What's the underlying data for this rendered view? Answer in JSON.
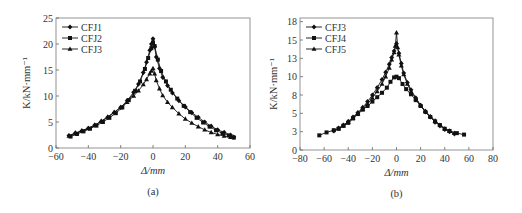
{
  "chart_data": [
    {
      "type": "line",
      "panel_label": "(a)",
      "title": "",
      "xlabel": "Δ/mm",
      "ylabel": "K/kN·mm⁻¹",
      "xlim": [
        -60,
        60
      ],
      "ylim": [
        0,
        25
      ],
      "xticks": [
        -60,
        -40,
        -20,
        0,
        20,
        40,
        60
      ],
      "xtick_labels": [
        "−60",
        "−40",
        "−20",
        "0",
        "20",
        "40",
        "60"
      ],
      "yticks": [
        0,
        5,
        10,
        15,
        20,
        25
      ],
      "ytick_labels": [
        "0",
        "5",
        "10",
        "15",
        "20",
        "25"
      ],
      "grid": false,
      "legend_position": "upper left",
      "series": [
        {
          "name": "CFJ1",
          "marker": "diamond",
          "x": [
            -52,
            -48,
            -44,
            -40,
            -36,
            -32,
            -28,
            -24,
            -20,
            -16,
            -12,
            -9,
            -6,
            -4,
            -2,
            -1,
            0,
            1,
            2,
            4,
            6,
            9,
            12,
            16,
            20,
            24,
            28,
            32,
            36,
            40,
            44,
            48,
            50
          ],
          "y": [
            2.4,
            2.9,
            3.3,
            3.8,
            4.4,
            5.1,
            5.9,
            6.8,
            7.8,
            9.1,
            10.7,
            12.3,
            14.5,
            16.5,
            18.8,
            20.0,
            21.0,
            19.5,
            17.5,
            15.3,
            13.6,
            12.0,
            10.6,
            9.1,
            7.9,
            6.8,
            5.9,
            5.0,
            4.2,
            3.5,
            3.0,
            2.5,
            2.1
          ]
        },
        {
          "name": "CFJ2",
          "marker": "square",
          "x": [
            -51,
            -47,
            -43,
            -39,
            -35,
            -31,
            -27,
            -23,
            -19,
            -15,
            -11,
            -8,
            -5,
            -3,
            -1,
            0,
            1,
            3,
            5,
            8,
            11,
            15,
            19,
            23,
            27,
            31,
            35,
            39,
            43,
            47,
            50
          ],
          "y": [
            2.2,
            2.7,
            3.2,
            3.7,
            4.3,
            5.0,
            5.8,
            6.7,
            7.8,
            9.2,
            11.0,
            12.8,
            15.2,
            17.3,
            19.2,
            20.3,
            19.6,
            17.0,
            14.8,
            12.8,
            11.2,
            9.5,
            8.1,
            6.9,
            5.8,
            4.9,
            4.1,
            3.4,
            2.8,
            2.4,
            2.0
          ]
        },
        {
          "name": "CFJ3",
          "marker": "triangle",
          "x": [
            -52,
            -48,
            -44,
            -40,
            -36,
            -32,
            -28,
            -24,
            -20,
            -16,
            -12,
            -9,
            -6,
            -4,
            -2,
            -1,
            0,
            1,
            2,
            4,
            6,
            9,
            12,
            16,
            20,
            24,
            28,
            32,
            36,
            40,
            44,
            48
          ],
          "y": [
            2.3,
            2.8,
            3.3,
            3.8,
            4.4,
            5.2,
            6.0,
            6.9,
            7.8,
            8.8,
            10.0,
            11.0,
            12.2,
            13.2,
            14.3,
            14.8,
            15.3,
            14.3,
            13.0,
            11.4,
            10.1,
            8.8,
            7.8,
            6.6,
            5.6,
            4.8,
            4.1,
            3.5,
            3.0,
            2.6,
            2.3,
            2.1
          ]
        }
      ]
    },
    {
      "type": "line",
      "panel_label": "(b)",
      "title": "",
      "xlabel": "Δ/mm",
      "ylabel": "K/kN·mm⁻¹",
      "xlim": [
        -80,
        80
      ],
      "ylim": [
        0,
        18
      ],
      "xticks": [
        -80,
        -60,
        -40,
        -20,
        0,
        20,
        40,
        60,
        80
      ],
      "xtick_labels": [
        "−80",
        "−60",
        "−40",
        "−20",
        "0",
        "20",
        "40",
        "60",
        "80"
      ],
      "yticks": [
        0,
        2.5,
        5,
        7.5,
        10,
        12.5,
        15,
        17.5
      ],
      "ytick_labels": [
        "0",
        "3",
        "5",
        "8",
        "10",
        "13",
        "15",
        "18"
      ],
      "grid": false,
      "legend_position": "upper left",
      "series": [
        {
          "name": "CFJ3",
          "marker": "diamond",
          "x": [
            -52,
            -48,
            -44,
            -40,
            -36,
            -32,
            -28,
            -24,
            -20,
            -16,
            -12,
            -9,
            -6,
            -4,
            -2,
            0,
            2,
            4,
            6,
            9,
            12,
            16,
            20,
            24,
            28,
            32,
            36,
            40,
            44,
            48
          ],
          "y": [
            2.6,
            3.0,
            3.4,
            3.9,
            4.5,
            5.1,
            5.8,
            6.6,
            7.5,
            8.5,
            9.6,
            10.6,
            11.7,
            12.6,
            13.5,
            14.5,
            13.2,
            11.8,
            10.5,
            9.2,
            8.2,
            7.1,
            6.1,
            5.2,
            4.5,
            3.8,
            3.3,
            2.8,
            2.5,
            2.2
          ]
        },
        {
          "name": "CFJ4",
          "marker": "square",
          "x": [
            -64,
            -58,
            -52,
            -48,
            -44,
            -40,
            -36,
            -32,
            -28,
            -24,
            -20,
            -16,
            -12,
            -8,
            -5,
            -2,
            0,
            2,
            5,
            8,
            12,
            16,
            20,
            24,
            28,
            32,
            36,
            40,
            44,
            50,
            56
          ],
          "y": [
            2.0,
            2.4,
            2.7,
            2.9,
            3.3,
            3.7,
            4.3,
            4.9,
            5.5,
            6.0,
            6.6,
            7.2,
            7.8,
            8.5,
            9.3,
            9.9,
            10.0,
            9.8,
            9.0,
            8.3,
            7.6,
            6.8,
            6.0,
            5.2,
            4.5,
            3.9,
            3.4,
            2.9,
            2.6,
            2.3,
            2.1
          ]
        },
        {
          "name": "CFJ5",
          "marker": "triangle",
          "x": [
            -48,
            -44,
            -40,
            -36,
            -32,
            -28,
            -24,
            -20,
            -16,
            -12,
            -9,
            -6,
            -4,
            -2,
            -1,
            0,
            1,
            2,
            4,
            6,
            9,
            12,
            16,
            20,
            24,
            28,
            32,
            36,
            40,
            44,
            48
          ],
          "y": [
            2.9,
            3.3,
            3.8,
            4.4,
            5.0,
            5.6,
            6.3,
            7.1,
            8.0,
            9.0,
            10.0,
            11.2,
            12.3,
            13.3,
            14.2,
            16.0,
            14.0,
            13.0,
            11.5,
            10.3,
            9.0,
            8.0,
            7.0,
            6.1,
            5.3,
            4.6,
            4.0,
            3.4,
            2.9,
            2.6,
            2.3
          ]
        }
      ]
    }
  ]
}
